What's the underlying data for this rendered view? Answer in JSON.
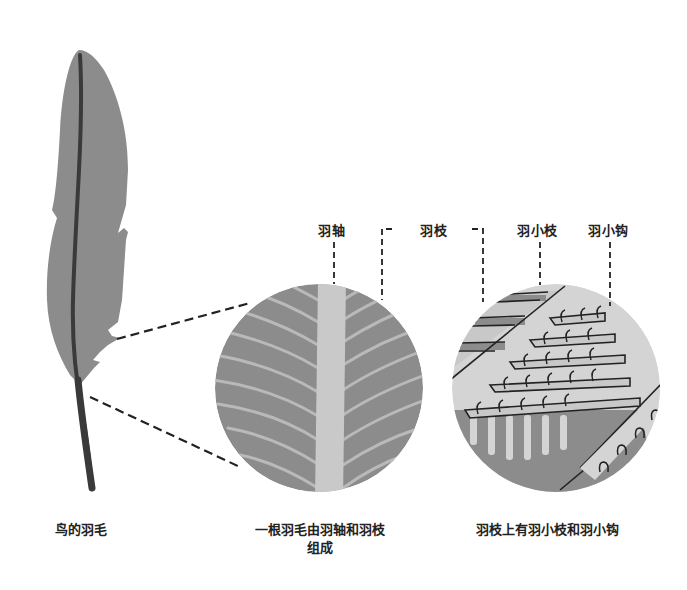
{
  "diagram": {
    "labels": {
      "rachis": "羽轴",
      "barb": "羽枝",
      "barbule": "羽小枝",
      "barbicel": "羽小钩"
    },
    "captions": {
      "feather": "鸟的羽毛",
      "composition_line1": "一根羽毛由羽轴和羽枝",
      "composition_line2": "组成",
      "barb_detail": "羽枝上有羽小枝和羽小钩"
    },
    "colors": {
      "vane": "#8c8c8c",
      "shaft": "#3a3a3a",
      "rachis_light": "#c9c9c9",
      "barb_line": "#b9b9b9",
      "dash": "#222222"
    }
  }
}
